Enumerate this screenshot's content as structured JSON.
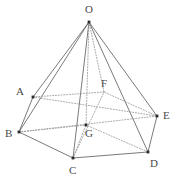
{
  "figure": {
    "type": "geometry-diagram",
    "canvas": {
      "width": 185,
      "height": 189,
      "background": "#ffffff"
    },
    "colors": {
      "solid_edge": "#6b6b6b",
      "hidden_edge": "#9a9a9a",
      "vertex_dot": "#2b2b2b",
      "label_text": "#4a4a4a"
    },
    "vertices": [
      {
        "id": "O",
        "label": "O",
        "x": 89,
        "y": 22,
        "label_x": 85,
        "label_y": 4,
        "dot": true,
        "role": "apex"
      },
      {
        "id": "A",
        "label": "A",
        "x": 33,
        "y": 97,
        "label_x": 16,
        "label_y": 86,
        "dot": true,
        "role": "base-vertex"
      },
      {
        "id": "B",
        "label": "B",
        "x": 19,
        "y": 132,
        "label_x": 5,
        "label_y": 128,
        "dot": true,
        "role": "base-vertex"
      },
      {
        "id": "C",
        "label": "C",
        "x": 73,
        "y": 158,
        "label_x": 69,
        "label_y": 165,
        "dot": true,
        "role": "base-vertex"
      },
      {
        "id": "D",
        "label": "D",
        "x": 148,
        "y": 152,
        "label_x": 150,
        "label_y": 158,
        "dot": true,
        "role": "base-vertex"
      },
      {
        "id": "E",
        "label": "E",
        "x": 157,
        "y": 116,
        "label_x": 163,
        "label_y": 110,
        "dot": true,
        "role": "base-vertex"
      },
      {
        "id": "F",
        "label": "F",
        "x": 104,
        "y": 92,
        "label_x": 101,
        "label_y": 78,
        "dot": false,
        "role": "base-vertex-hidden"
      },
      {
        "id": "G",
        "label": "G",
        "x": 86,
        "y": 125,
        "label_x": 85,
        "label_y": 128,
        "dot": true,
        "role": "base-center"
      }
    ],
    "edges": [
      {
        "from": "O",
        "to": "A",
        "style": "solid"
      },
      {
        "from": "O",
        "to": "B",
        "style": "solid"
      },
      {
        "from": "O",
        "to": "C",
        "style": "solid"
      },
      {
        "from": "O",
        "to": "D",
        "style": "solid"
      },
      {
        "from": "O",
        "to": "E",
        "style": "solid"
      },
      {
        "from": "O",
        "to": "F",
        "style": "dotted"
      },
      {
        "from": "O",
        "to": "G",
        "style": "dotted"
      },
      {
        "from": "A",
        "to": "B",
        "style": "solid"
      },
      {
        "from": "B",
        "to": "C",
        "style": "solid"
      },
      {
        "from": "C",
        "to": "D",
        "style": "solid"
      },
      {
        "from": "D",
        "to": "E",
        "style": "solid"
      },
      {
        "from": "E",
        "to": "F",
        "style": "dotted"
      },
      {
        "from": "F",
        "to": "A",
        "style": "dotted"
      },
      {
        "from": "A",
        "to": "E",
        "style": "dotted"
      },
      {
        "from": "B",
        "to": "E",
        "style": "dotted"
      },
      {
        "from": "C",
        "to": "F",
        "style": "dotted"
      },
      {
        "from": "B",
        "to": "G",
        "style": "dotted"
      },
      {
        "from": "C",
        "to": "G",
        "style": "dotted"
      },
      {
        "from": "D",
        "to": "G",
        "style": "dotted"
      }
    ]
  }
}
